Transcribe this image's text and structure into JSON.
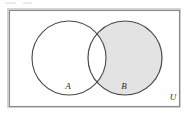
{
  "figure": {
    "type": "venn-diagram",
    "width": 189,
    "height": 117,
    "background_color": "#ffffff"
  },
  "universe": {
    "label": "U",
    "label_x": 173,
    "label_y": 98,
    "rect": {
      "x": 9,
      "y": 10,
      "width": 171,
      "height": 97
    },
    "border_color": "#8a8a8a",
    "fill_color": "#ffffff"
  },
  "sets": [
    {
      "label": "A",
      "label_x": 68,
      "label_y": 87,
      "cx": 69,
      "cy": 58,
      "r": 37,
      "fill_color": "#ffffff",
      "stroke_color": "#4a4a4a"
    },
    {
      "label": "B",
      "label_x": 124,
      "label_y": 87,
      "cx": 125,
      "cy": 58,
      "r": 37,
      "fill_color": "#ffffff",
      "stroke_color": "#4a4a4a"
    }
  ],
  "shading": {
    "region": "B minus A",
    "color": "#e3e3e3",
    "intersection_shaded": false
  },
  "colors": {
    "shade": "#e3e3e3",
    "circle_stroke": "#4a4a4a",
    "rect_stroke": "#8a8a8a",
    "text": "#2b2b2b",
    "paper": "#ffffff"
  }
}
